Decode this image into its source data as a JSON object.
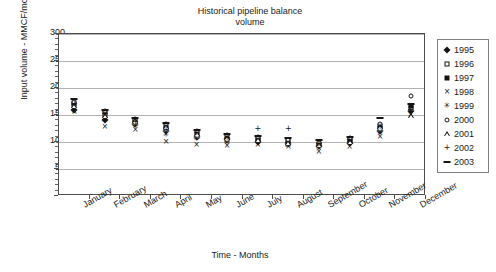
{
  "chart_data": {
    "type": "scatter",
    "title": "Historical pipeline balance\nvolume",
    "title_line1": "Historical pipeline balance",
    "title_line2": "volume",
    "xlabel": "Time - Months",
    "ylabel": "Input volume - MMCF/mo",
    "ylim": [
      0,
      300
    ],
    "yticks": [
      0,
      50,
      100,
      150,
      200,
      250,
      300
    ],
    "ytick_labels": [
      "-",
      "50",
      "100",
      "150",
      "200",
      "250",
      "300"
    ],
    "grid": true,
    "legend_position": "right-outside",
    "categories": [
      "January",
      "February",
      "March",
      "April",
      "May",
      "June",
      "July",
      "August",
      "September",
      "October",
      "November",
      "December"
    ],
    "series": [
      {
        "name": "1995",
        "marker": "diamond-filled",
        "values": [
          160,
          140,
          133,
          120,
          110,
          105,
          100,
          98,
          92,
          98,
          120,
          158
        ]
      },
      {
        "name": "1996",
        "marker": "square-open",
        "values": [
          168,
          150,
          136,
          125,
          112,
          103,
          104,
          97,
          95,
          101,
          124,
          163
        ]
      },
      {
        "name": "1997",
        "marker": "square-filled",
        "values": [
          172,
          156,
          140,
          130,
          118,
          110,
          106,
          101,
          97,
          104,
          130,
          167
        ]
      },
      {
        "name": "1998",
        "marker": "cross-x",
        "values": [
          155,
          128,
          122,
          100,
          95,
          92,
          94,
          90,
          82,
          90,
          110,
          150
        ]
      },
      {
        "name": "1999",
        "marker": "star-asterisk",
        "values": [
          163,
          145,
          130,
          113,
          105,
          99,
          98,
          95,
          88,
          96,
          116,
          155
        ]
      },
      {
        "name": "2000",
        "marker": "circle-open",
        "values": [
          175,
          158,
          143,
          133,
          120,
          113,
          109,
          104,
          99,
          107,
          134,
          185
        ]
      },
      {
        "name": "2001",
        "marker": "triangle-open",
        "values": [
          166,
          148,
          138,
          127,
          115,
          107,
          103,
          99,
          94,
          100,
          128,
          148
        ]
      },
      {
        "name": "2002",
        "marker": "plus",
        "values": [
          170,
          152,
          137,
          122,
          116,
          108,
          125,
          124,
          96,
          103,
          127,
          160
        ]
      },
      {
        "name": "2003",
        "marker": "dash",
        "values": [
          180,
          160,
          145,
          135,
          122,
          115,
          112,
          107,
          104,
          110,
          145,
          170
        ]
      }
    ]
  },
  "legend": {
    "items": [
      {
        "label": "1995",
        "marker": "diamond-filled"
      },
      {
        "label": "1996",
        "marker": "square-open"
      },
      {
        "label": "1997",
        "marker": "square-filled"
      },
      {
        "label": "1998",
        "marker": "cross-x"
      },
      {
        "label": "1999",
        "marker": "star-asterisk"
      },
      {
        "label": "2000",
        "marker": "circle-open"
      },
      {
        "label": "2001",
        "marker": "triangle-open"
      },
      {
        "label": "2002",
        "marker": "plus"
      },
      {
        "label": "2003",
        "marker": "dash"
      }
    ]
  },
  "colors": {
    "marker": "#141414",
    "gridline": "#b3b3b3",
    "frame": "#4d4d4d",
    "text": "#1a1a1a",
    "background": "#ffffff"
  }
}
